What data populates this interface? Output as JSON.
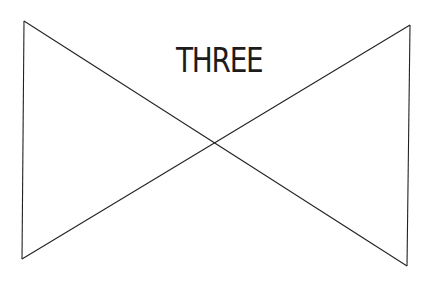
{
  "diagram": {
    "label": "THREE",
    "stroke_color": "#222222",
    "background": "#ffffff",
    "shape": "bowtie",
    "vertices": {
      "top_left": [
        24,
        21
      ],
      "top_right": [
        410,
        25
      ],
      "bottom_left": [
        22,
        259
      ],
      "bottom_right": [
        407,
        266
      ]
    }
  }
}
